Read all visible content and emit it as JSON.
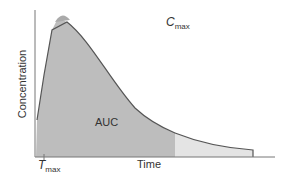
{
  "diagram": {
    "type": "pharmacokinetic concentration-time curve",
    "y_axis_label": "Concentration",
    "x_axis_label": "Time",
    "area_label": "AUC",
    "tmax_symbol": "T",
    "tmax_sub": "max",
    "cmax_symbol": "C",
    "cmax_sub": "max",
    "colors": {
      "auc_fill": "#bdbdbd",
      "tail_fill": "#e4e4e4",
      "curve": "#555555",
      "axis": "#777777"
    }
  }
}
